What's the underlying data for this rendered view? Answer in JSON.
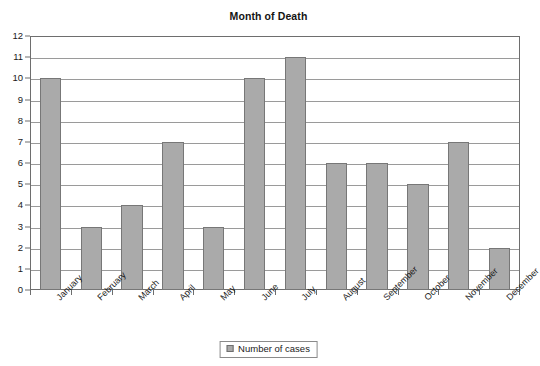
{
  "chart_data": {
    "type": "bar",
    "title": "Month of Death",
    "xlabel": "",
    "ylabel": "",
    "categories": [
      "January",
      "February",
      "March",
      "April",
      "May",
      "June",
      "July",
      "August",
      "September",
      "October",
      "November",
      "December"
    ],
    "values": [
      10,
      3,
      4,
      7,
      3,
      10,
      11,
      6,
      6,
      5,
      7,
      2
    ],
    "series": [
      {
        "name": "Number of cases",
        "values": [
          10,
          3,
          4,
          7,
          3,
          10,
          11,
          6,
          6,
          5,
          7,
          2
        ]
      }
    ],
    "ylim": [
      0,
      12
    ],
    "ytick_step": 1,
    "yticks": [
      0,
      1,
      2,
      3,
      4,
      5,
      6,
      7,
      8,
      9,
      10,
      11,
      12
    ],
    "ytick_labels": [
      "0",
      "1",
      "2",
      "3",
      "4",
      "5",
      "6",
      "7",
      "8",
      "9",
      "10",
      "11",
      "12"
    ],
    "grid": true,
    "grid_axis": "y",
    "legend": {
      "position": "bottom",
      "entries": [
        {
          "label": "Number of cases",
          "swatch_name": "legend-swatch-number-of-cases"
        }
      ]
    },
    "colors": {
      "bar_fill": "#aaaaaa",
      "bar_border": "#777777",
      "gridline": "#9a9a9a",
      "axis": "#6e6e6e",
      "text": "#1a1a1a",
      "background": "#ffffff"
    },
    "xtick_rotation": -45
  }
}
